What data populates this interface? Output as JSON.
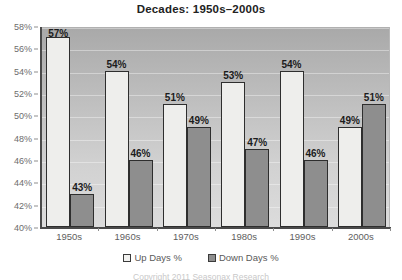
{
  "chart_data": {
    "type": "bar",
    "title": "Decades: 1950s–2000s",
    "xlabel": "",
    "ylabel": "",
    "ylim": [
      40,
      58
    ],
    "ytick_step": 2,
    "grid": true,
    "legend_position": "bottom",
    "categories": [
      "1950s",
      "1960s",
      "1970s",
      "1980s",
      "1990s",
      "2000s"
    ],
    "ytick_labels": [
      "58%",
      "56%",
      "54%",
      "52%",
      "50%",
      "48%",
      "46%",
      "44%",
      "42%",
      "40%"
    ],
    "ytick_values": [
      58,
      56,
      54,
      52,
      50,
      48,
      46,
      44,
      42,
      40
    ],
    "series": [
      {
        "name": "Up Days %",
        "color": "#eeeeec",
        "values": [
          57,
          54,
          51,
          53,
          54,
          49
        ],
        "labels": [
          "57%",
          "54%",
          "51%",
          "53%",
          "54%",
          "49%"
        ]
      },
      {
        "name": "Down Days %",
        "color": "#8e8e8e",
        "values": [
          43,
          46,
          49,
          47,
          46,
          51
        ],
        "labels": [
          "43%",
          "46%",
          "49%",
          "47%",
          "46%",
          "51%"
        ]
      }
    ]
  },
  "legend": {
    "items": [
      {
        "label": "Up Days %",
        "swatch": "up"
      },
      {
        "label": "Down Days %",
        "swatch": "down"
      }
    ]
  },
  "footer": {
    "text": "Copyright 2011 Seasonax Research"
  }
}
